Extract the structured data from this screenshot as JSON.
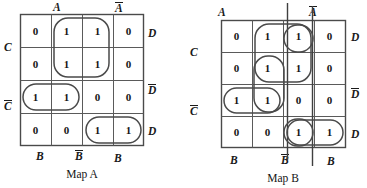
{
  "maps": [
    {
      "id": "map-a",
      "caption": "Map A",
      "top_labels": [
        {
          "text": "A",
          "overbar": false
        },
        {
          "text": "A",
          "overbar": true
        }
      ],
      "bottom_labels": [
        {
          "text": "B",
          "overbar": false
        },
        {
          "text": "B",
          "overbar": true
        },
        {
          "text": "B",
          "overbar": false
        }
      ],
      "left_labels": [
        {
          "text": "C",
          "overbar": false
        },
        {
          "text": "C",
          "overbar": true
        }
      ],
      "right_labels": [
        {
          "text": "D",
          "overbar": false
        },
        {
          "text": "D",
          "overbar": true
        },
        {
          "text": "D",
          "overbar": false
        }
      ],
      "cells": [
        [
          "0",
          "1",
          "1",
          "0"
        ],
        [
          "0",
          "1",
          "1",
          "0"
        ],
        [
          "1",
          "1",
          "0",
          "0"
        ],
        [
          "0",
          "0",
          "1",
          "1"
        ]
      ],
      "groups": [
        {
          "name": "group-top-middle-2x2",
          "row": 0,
          "col": 1,
          "rowspan": 2,
          "colspan": 2
        },
        {
          "name": "group-row3-left-1x2",
          "row": 2,
          "col": 0,
          "rowspan": 1,
          "colspan": 2
        },
        {
          "name": "group-row4-right-1x2",
          "row": 3,
          "col": 2,
          "rowspan": 1,
          "colspan": 2
        }
      ],
      "axis_markers": []
    },
    {
      "id": "map-b",
      "caption": "Map B",
      "top_labels": [
        {
          "text": "A",
          "overbar": false
        },
        {
          "text": "A",
          "overbar": true
        }
      ],
      "bottom_labels": [
        {
          "text": "B",
          "overbar": false
        },
        {
          "text": "B",
          "overbar": true
        },
        {
          "text": "B",
          "overbar": false
        }
      ],
      "left_labels": [
        {
          "text": "C",
          "overbar": false
        },
        {
          "text": "C",
          "overbar": true
        }
      ],
      "right_labels": [
        {
          "text": "D",
          "overbar": false
        },
        {
          "text": "D",
          "overbar": true
        },
        {
          "text": "D",
          "overbar": false
        }
      ],
      "cells": [
        [
          "0",
          "1",
          "1",
          "0"
        ],
        [
          "0",
          "1",
          "1",
          "0"
        ],
        [
          "1",
          "1",
          "0",
          "0"
        ],
        [
          "0",
          "0",
          "1",
          "1"
        ]
      ],
      "groups": [
        {
          "name": "group-top-middle-2x2",
          "row": 0,
          "col": 1,
          "rowspan": 2,
          "colspan": 2
        },
        {
          "name": "group-cell-r1c3",
          "row": 0,
          "col": 2,
          "rowspan": 1,
          "colspan": 1
        },
        {
          "name": "group-col2-r2r3",
          "row": 1,
          "col": 1,
          "rowspan": 2,
          "colspan": 1
        },
        {
          "name": "group-row3-left-1x2",
          "row": 2,
          "col": 0,
          "rowspan": 1,
          "colspan": 2
        },
        {
          "name": "group-row4-right-1x2",
          "row": 3,
          "col": 2,
          "rowspan": 1,
          "colspan": 2
        },
        {
          "name": "group-cell-r4c3",
          "row": 3,
          "col": 2,
          "rowspan": 1,
          "colspan": 1
        }
      ],
      "axis_markers": [
        {
          "name": "vertical-marker-left",
          "col_boundary": 2
        },
        {
          "name": "vertical-marker-right",
          "col_boundary": 3
        }
      ]
    }
  ],
  "colors": {
    "ink": "#1a1a1a",
    "grid": "#5a5a5a",
    "loop": "#4a4a4a",
    "background": "#ffffff"
  }
}
